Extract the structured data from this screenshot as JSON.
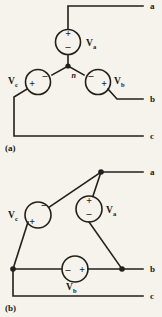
{
  "page": {
    "background_color": "#f5f3ec",
    "ink_color": "#221f1c",
    "width": 162,
    "height": 317
  },
  "figures": [
    {
      "id": "figure-a",
      "caption": "(a)",
      "connection": "wye",
      "neutral_label": "n",
      "terminals": [
        {
          "name": "terminal-a",
          "label": "a"
        },
        {
          "name": "terminal-b",
          "label": "b"
        },
        {
          "name": "terminal-c",
          "label": "c"
        }
      ],
      "sources": [
        {
          "name": "source-va",
          "label_main": "V",
          "label_sub": "a",
          "plus": "+",
          "minus": "–",
          "plus_position": "top",
          "minus_position": "bottom",
          "label_position": "right"
        },
        {
          "name": "source-vb",
          "label_main": "V",
          "label_sub": "b",
          "plus": "+",
          "minus": "–",
          "plus_position": "right",
          "minus_position": "left",
          "label_position": "right"
        },
        {
          "name": "source-vc",
          "label_main": "V",
          "label_sub": "c",
          "plus": "+",
          "minus": "–",
          "plus_position": "left",
          "minus_position": "right",
          "label_position": "left"
        }
      ]
    },
    {
      "id": "figure-b",
      "caption": "(b)",
      "connection": "delta",
      "terminals": [
        {
          "name": "terminal-a",
          "label": "a"
        },
        {
          "name": "terminal-b",
          "label": "b"
        },
        {
          "name": "terminal-c",
          "label": "c"
        }
      ],
      "sources": [
        {
          "name": "source-va",
          "label_main": "V",
          "label_sub": "a",
          "plus": "+",
          "minus": "–",
          "plus_position": "top",
          "minus_position": "bottom",
          "label_position": "right"
        },
        {
          "name": "source-vb",
          "label_main": "V",
          "label_sub": "b",
          "plus": "+",
          "minus": "–",
          "plus_position": "right",
          "minus_position": "left",
          "label_position": "below"
        },
        {
          "name": "source-vc",
          "label_main": "V",
          "label_sub": "c",
          "plus": "+",
          "minus": "–",
          "plus_position": "bottom",
          "minus_position": "top",
          "label_position": "left"
        }
      ]
    }
  ]
}
